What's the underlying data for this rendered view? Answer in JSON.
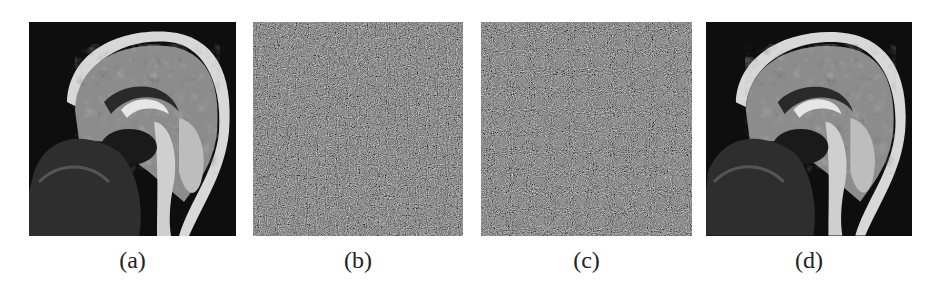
{
  "figure": {
    "panels": [
      {
        "id": "a",
        "label": "(a)",
        "content": "original sagittal brain MRI"
      },
      {
        "id": "b",
        "label": "(b)",
        "content": "encrypted noise-like image"
      },
      {
        "id": "c",
        "label": "(c)",
        "content": "encrypted noise-like image"
      },
      {
        "id": "d",
        "label": "(d)",
        "content": "decrypted sagittal brain MRI"
      }
    ]
  }
}
